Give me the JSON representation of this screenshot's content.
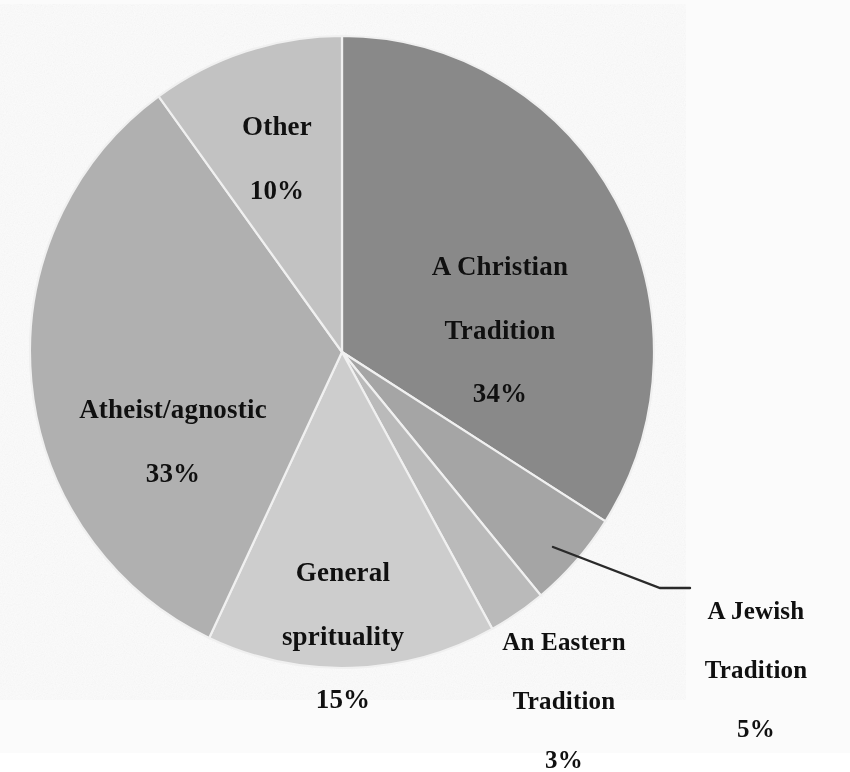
{
  "chart_data": {
    "type": "pie",
    "title": "",
    "subtitle": "",
    "xlabel": "",
    "ylabel": "",
    "legend_position": "none",
    "grid": false,
    "labels_inside": true,
    "value_suffix": "%",
    "categories": [
      "A Christian Tradition",
      "A Jewish Tradition",
      "An Eastern Tradition",
      "General sprituality",
      "Atheist/agnostic",
      "Other"
    ],
    "values": [
      34,
      5,
      3,
      15,
      33,
      10
    ],
    "slices": [
      {
        "name": "A Christian Tradition",
        "label_line1": "A Christian",
        "label_line2": "Tradition",
        "value": 34,
        "value_text": "34%",
        "color": "#8a8a8a",
        "start_angle_deg": 0,
        "end_angle_deg": 122.4,
        "label_placement": "inside"
      },
      {
        "name": "A Jewish Tradition",
        "label_line1": "A Jewish",
        "label_line2": "Tradition",
        "value": 5,
        "value_text": "5%",
        "color": "#a6a6a6",
        "start_angle_deg": 122.4,
        "end_angle_deg": 140.4,
        "label_placement": "outside-leader"
      },
      {
        "name": "An Eastern Tradition",
        "label_line1": "An Eastern",
        "label_line2": "Tradition",
        "value": 3,
        "value_text": "3%",
        "color": "#bcbcbc",
        "start_angle_deg": 140.4,
        "end_angle_deg": 151.2,
        "label_placement": "outside"
      },
      {
        "name": "General sprituality",
        "label_line1": "General",
        "label_line2": "sprituality",
        "value": 15,
        "value_text": "15%",
        "color": "#cfcfcf",
        "start_angle_deg": 151.2,
        "end_angle_deg": 205.2,
        "label_placement": "inside"
      },
      {
        "name": "Atheist/agnostic",
        "label_line1": "Atheist/agnostic",
        "label_line2": "",
        "value": 33,
        "value_text": "33%",
        "color": "#b2b2b2",
        "start_angle_deg": 205.2,
        "end_angle_deg": 324.0,
        "label_placement": "inside"
      },
      {
        "name": "Other",
        "label_line1": "Other",
        "label_line2": "",
        "value": 10,
        "value_text": "10%",
        "color": "#c4c4c4",
        "start_angle_deg": 324.0,
        "end_angle_deg": 360.0,
        "label_placement": "inside"
      }
    ],
    "colors": {
      "christian": "#8a8a8a",
      "jewish": "#a6a6a6",
      "eastern": "#bcbcbc",
      "spirituality": "#cfcfcf",
      "atheist": "#b2b2b2",
      "other": "#c4c4c4",
      "background": "#fdfdfd",
      "text": "#101010",
      "leader_line": "#2a2a2a"
    }
  }
}
